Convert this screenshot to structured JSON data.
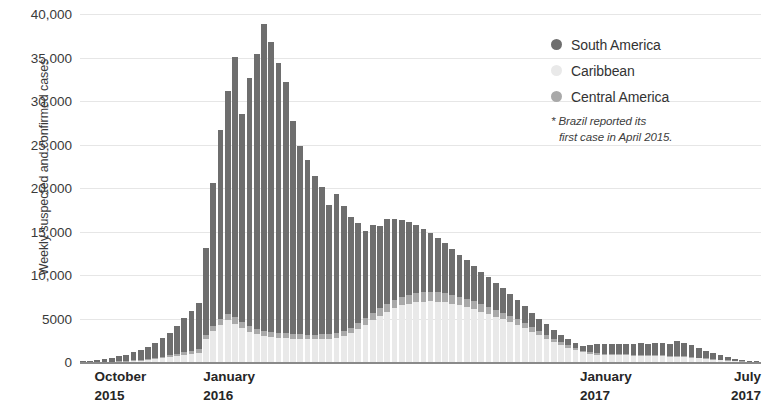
{
  "chart_data": {
    "type": "bar",
    "subtype": "stacked-bar",
    "title": "",
    "subtitle": "",
    "xlabel": "",
    "ylabel": "Weekly suspected and confirmed cases",
    "ylim": [
      0,
      40000
    ],
    "ytick_values": [
      0,
      5000,
      10000,
      15000,
      20000,
      25000,
      30000,
      35000,
      40000
    ],
    "ytick_labels": [
      "0",
      "5000",
      "10,000",
      "15,000",
      "20,000",
      "25,000",
      "30,000",
      "35,000",
      "40,000"
    ],
    "grid": true,
    "grid_axis": "y",
    "legend_position": "top-right",
    "xtick_labels": [
      {
        "month": "October",
        "year": "2015",
        "index": 2
      },
      {
        "month": "January",
        "year": "2016",
        "index": 17
      },
      {
        "month": "January",
        "year": "2017",
        "index": 69
      },
      {
        "month": "July",
        "year": "2017",
        "index": 92
      }
    ],
    "annotations": [
      {
        "text": "* Brazil reported its first case in April 2015."
      }
    ],
    "series": [
      {
        "name": "Caribbean",
        "color": "#e9e9e9",
        "values": [
          0,
          0,
          10,
          20,
          30,
          60,
          90,
          130,
          180,
          240,
          320,
          420,
          520,
          640,
          780,
          900,
          1050,
          2600,
          3550,
          4200,
          4800,
          4400,
          3900,
          3500,
          3200,
          3000,
          2900,
          2800,
          2750,
          2700,
          2650,
          2600,
          2600,
          2650,
          2700,
          2800,
          3000,
          3300,
          3800,
          4300,
          4800,
          5300,
          5800,
          6200,
          6500,
          6700,
          6850,
          6950,
          7000,
          6950,
          6850,
          6700,
          6500,
          6300,
          6050,
          5800,
          5500,
          5200,
          4900,
          4600,
          4300,
          3900,
          3500,
          3100,
          2700,
          2300,
          1950,
          1650,
          1350,
          1100,
          950,
          850,
          800,
          780,
          760,
          750,
          740,
          730,
          720,
          700,
          680,
          650,
          620,
          580,
          520,
          450,
          380,
          300,
          230,
          160,
          110,
          70,
          40,
          20
        ]
      },
      {
        "name": "Central America",
        "color": "#a9a9a9",
        "values": [
          0,
          0,
          5,
          10,
          20,
          35,
          50,
          70,
          95,
          120,
          150,
          190,
          230,
          280,
          330,
          380,
          430,
          520,
          620,
          700,
          760,
          720,
          680,
          640,
          610,
          580,
          560,
          550,
          540,
          530,
          520,
          510,
          510,
          520,
          530,
          550,
          580,
          620,
          680,
          740,
          800,
          860,
          920,
          970,
          1010,
          1040,
          1060,
          1070,
          1080,
          1070,
          1060,
          1040,
          1010,
          980,
          940,
          900,
          860,
          810,
          760,
          710,
          660,
          600,
          540,
          480,
          420,
          360,
          300,
          250,
          210,
          175,
          150,
          135,
          125,
          120,
          118,
          115,
          112,
          110,
          108,
          105,
          100,
          95,
          90,
          85,
          78,
          68,
          58,
          46,
          35,
          25,
          17,
          11,
          6,
          3
        ]
      },
      {
        "name": "South America",
        "color": "#6e6e6e",
        "values": [
          60,
          120,
          200,
          300,
          420,
          560,
          720,
          900,
          1100,
          1350,
          1700,
          2100,
          2600,
          3200,
          3900,
          4600,
          5300,
          10000,
          16400,
          21800,
          25600,
          29900,
          23900,
          28500,
          31600,
          35300,
          33300,
          31000,
          28900,
          24500,
          21700,
          20100,
          18300,
          17000,
          14800,
          16000,
          14300,
          12700,
          11500,
          10000,
          10200,
          9500,
          9700,
          9300,
          8800,
          8300,
          7800,
          7300,
          6800,
          6200,
          5800,
          5300,
          4800,
          4400,
          4000,
          3700,
          3400,
          3100,
          2800,
          2500,
          2200,
          1900,
          1650,
          1400,
          1200,
          1000,
          850,
          700,
          600,
          520,
          900,
          1050,
          1150,
          1200,
          1150,
          1250,
          1200,
          1300,
          1250,
          1350,
          1400,
          1300,
          1700,
          1500,
          1350,
          1100,
          880,
          680,
          500,
          360,
          240,
          150,
          80,
          35
        ]
      }
    ]
  },
  "legend": {
    "items": [
      {
        "label": "South America",
        "color": "#6e6e6e"
      },
      {
        "label": "Caribbean",
        "color": "#e9e9e9"
      },
      {
        "label": "Central America",
        "color": "#a9a9a9"
      }
    ],
    "note_line1": "* Brazil reported its",
    "note_line2": "first case in April 2015."
  },
  "axes": {
    "y_title": "Weekly suspected and confirmed cases"
  },
  "colors": {
    "south_america": "#6e6e6e",
    "caribbean": "#e9e9e9",
    "central_america": "#a9a9a9",
    "gridline": "#e6e6e6",
    "axis": "#8a8a8a",
    "text": "#3a3a3a"
  }
}
